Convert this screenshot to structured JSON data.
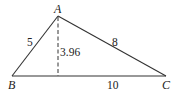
{
  "diagram": {
    "type": "triangle",
    "vertices": {
      "A": {
        "label": "A"
      },
      "B": {
        "label": "B"
      },
      "C": {
        "label": "C"
      }
    },
    "sides": {
      "AB": "5",
      "AC": "8",
      "BC": "10"
    },
    "altitude": {
      "from": "A",
      "to": "BC",
      "length": "3.96",
      "style": "dashed"
    },
    "colors": {
      "stroke": "#333333",
      "text": "#222222",
      "background": "#ffffff"
    }
  }
}
